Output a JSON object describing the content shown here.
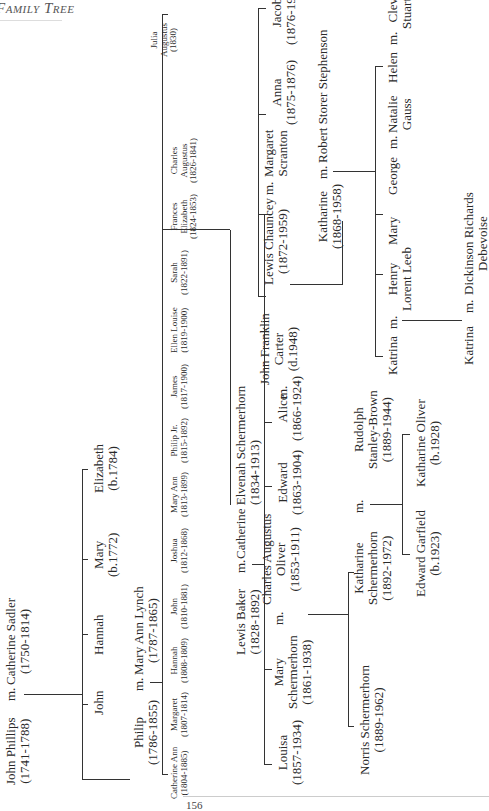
{
  "header": {
    "title": "Family Tree"
  },
  "footer": {
    "page_number": "156"
  },
  "tree": {
    "gen1": {
      "husband": {
        "name": "John Phillips",
        "dates": "(1741-1788)"
      },
      "marriage": "m.",
      "wife": {
        "name": "Catherine Sadler",
        "dates": "(1750-1814)"
      },
      "children": [
        {
          "name": "John",
          "dates": ""
        },
        {
          "name": "Hannah",
          "dates": ""
        },
        {
          "name": "Mary",
          "dates": "(b.1772)"
        },
        {
          "name": "Elizabeth",
          "dates": "(b.1784)"
        }
      ]
    },
    "gen2": {
      "husband": {
        "name": "Philip",
        "dates": "(1786-1855)"
      },
      "marriage": "m.",
      "wife": {
        "name": "Mary Ann Lynch",
        "dates": "(1787-1865)"
      },
      "children": [
        {
          "name": "Catherine Ann",
          "dates": "(1804-1885)"
        },
        {
          "name": "Margaret",
          "dates": "(1807-1814)"
        },
        {
          "name": "Hannah",
          "dates": "(1808-1809)"
        },
        {
          "name": "John",
          "dates": "(1810-1881)"
        },
        {
          "name": "Joshua",
          "dates": "(1812-1868)"
        },
        {
          "name": "Mary Ann",
          "dates": "(1813-1899)"
        },
        {
          "name": "Philip Jr.",
          "dates": "(1815-1892)"
        },
        {
          "name": "James",
          "dates": "(1817-1900)"
        },
        {
          "name": "Ellen Louise",
          "dates": "(1819-1900)"
        },
        {
          "name": "Sarah",
          "dates": "(1822-1891)"
        },
        {
          "name": "Frances Elizabeth",
          "line1": "Frances",
          "line2": "Elizabeth",
          "dates": "(1824-1853)"
        },
        {
          "name": "Charles Augustus",
          "line1": "Charles",
          "line2": "Augustus",
          "dates": "(1826-1841)"
        },
        {
          "name": "Julia Augustus",
          "line1": "Julia",
          "line2": "Augustus",
          "dates": "(1830)"
        }
      ]
    },
    "gen3": {
      "husband": {
        "name": "Lewis Baker",
        "dates": "(1828-1892)"
      },
      "marriage": "m.",
      "wife": {
        "name": "Catherine Elvenah Schermerhorn",
        "dates": "(1834-1913)"
      },
      "children": [
        {
          "name": "Louisa",
          "dates": "(1857-1934)"
        },
        {
          "name": "Mary Schermerhorn",
          "line1": "Mary",
          "line2": "Schermerhorn",
          "dates": "(1861-1938)",
          "spouse": {
            "name": "Charles Augustus Oliver",
            "line1": "Charles Augustus",
            "line2": "Oliver",
            "dates": "(1853-1911)"
          }
        },
        {
          "name": "Edward",
          "dates": "(1863-1904)"
        },
        {
          "name": "Alice",
          "dates": "(1866-1924)",
          "spouse": {
            "name": "John Franklin Carter",
            "line1": "John Franklin",
            "line2": "Carter",
            "dates": "(d.1948)"
          }
        },
        {
          "name": "Lewis Chauncey",
          "dates": "(1872-1959)",
          "spouse": {
            "name": "Margaret Scranton",
            "line1": "Margaret",
            "line2": "Scranton"
          }
        },
        {
          "name": "Anna",
          "dates": "(1875-1876)"
        },
        {
          "name": "Jacob",
          "dates": "(1876-1958)"
        }
      ]
    },
    "oliver_children": [
      {
        "name": "Norris Schermerhorn",
        "dates": "(1889-1962)"
      },
      {
        "name": "Katharine Schermerhorn",
        "line1": "Katharine",
        "line2": "Schermerhorn",
        "dates": "(1892-1972)",
        "spouse": {
          "name": "Rudolph Stanley-Brown",
          "line1": "Rudolph",
          "line2": "Stanley-Brown",
          "dates": "(1889-1944)"
        }
      }
    ],
    "stanley_brown_children": [
      {
        "name": "Edward Garfield",
        "dates": "(b.1923)"
      },
      {
        "name": "Katharine Oliver",
        "dates": "(b.1928)"
      }
    ],
    "chauncey_children": [
      {
        "name": "Katharine",
        "dates": "(1868-1958)",
        "spouse": {
          "name": "Robert Storer Stephenson"
        }
      }
    ],
    "stephenson_children": [
      {
        "name": "Katrina",
        "spouse": {
          "name": "Henry Lorent Leeb",
          "line1": "Henry",
          "line2": "Lorent Leeb"
        }
      },
      {
        "name": "Mary"
      },
      {
        "name": "George",
        "spouse": {
          "name": "Natalie Gauss",
          "line1": "Natalie",
          "line2": "Gauss"
        }
      },
      {
        "name": "Helen",
        "spouse": {
          "name": "Cleveland Stuart White",
          "line1": "Cleveland",
          "line2": "Stuart White"
        }
      }
    ],
    "leeb_children": [
      {
        "name": "Katrina",
        "spouse": {
          "name": "Dickinson Richards Debevoise",
          "line1": "Dickinson Richards",
          "line2": "Debevoise"
        }
      }
    ]
  }
}
